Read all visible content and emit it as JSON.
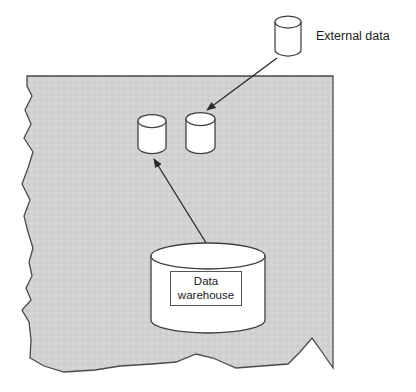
{
  "diagram": {
    "type": "block-diagram",
    "background_color": "#ffffff",
    "shaded_region": {
      "name": "enterprise-boundary",
      "fill_color": "#d2d2d2",
      "stroke_color": "#4a4a4a",
      "edge_style": "torn-jagged-left-and-bottom",
      "description": "Irregular torn-paper shaded area representing the enterprise environment"
    },
    "labels": {
      "external_data": "External data",
      "data_warehouse_line_1": "Data",
      "data_warehouse_line_2": "warehouse"
    },
    "nodes": [
      {
        "id": "external-data-cylinder",
        "shape": "cylinder",
        "label": "External data",
        "inside_boundary": false,
        "fill_color": "#ffffff",
        "stroke_color": "#3f3f3f"
      },
      {
        "id": "internal-cylinder-left",
        "shape": "cylinder",
        "label": "",
        "inside_boundary": true,
        "fill_color": "#ffffff",
        "stroke_color": "#3f3f3f"
      },
      {
        "id": "internal-cylinder-right",
        "shape": "cylinder",
        "label": "",
        "inside_boundary": true,
        "fill_color": "#ffffff",
        "stroke_color": "#3f3f3f"
      },
      {
        "id": "data-warehouse-cylinder",
        "shape": "cylinder",
        "label": "Data warehouse",
        "inside_boundary": true,
        "fill_color": "#ffffff",
        "stroke_color": "#3f3f3f"
      }
    ],
    "edges": [
      {
        "id": "arrow-external-to-internal-right",
        "from": "external-data-cylinder",
        "to": "internal-cylinder-right",
        "style": "solid",
        "arrowhead": "filled-triangle",
        "stroke_color": "#2b2b2b"
      },
      {
        "id": "arrow-warehouse-to-internal-left",
        "from": "data-warehouse-cylinder",
        "to": "internal-cylinder-left",
        "style": "solid",
        "arrowhead": "filled-triangle",
        "stroke_color": "#2b2b2b"
      }
    ]
  }
}
